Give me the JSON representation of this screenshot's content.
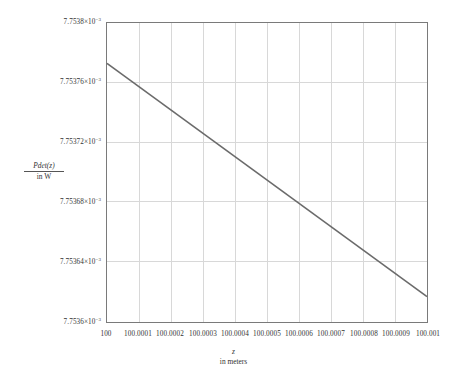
{
  "chart_data": {
    "type": "line",
    "title": "",
    "xlabel": "z",
    "xlabel_unit": "in meters",
    "ylabel_numerator": "Pdet(z)",
    "ylabel_denominator": "in W",
    "grid": true,
    "legend": "none",
    "xlim": [
      100,
      100.001
    ],
    "ylim": [
      0.0077536,
      0.0077538
    ],
    "x_tick_values": [
      100,
      100.0001,
      100.0002,
      100.0003,
      100.0004,
      100.0005,
      100.0006,
      100.0007,
      100.0008,
      100.0009,
      100.001
    ],
    "x_tick_labels": [
      "100",
      "100.0001",
      "100.0002",
      "100.0003",
      "100.0004",
      "100.0005",
      "100.0006",
      "100.0007",
      "100.0008",
      "100.0009",
      "100.001"
    ],
    "y_tick_values": [
      0.0077536,
      0.00775364,
      0.00775368,
      0.00775372,
      0.00775376,
      0.0077538
    ],
    "y_tick_labels": [
      {
        "mantissa": "7.7536×10",
        "exponent": "−3"
      },
      {
        "mantissa": "7.75364×10",
        "exponent": "−3"
      },
      {
        "mantissa": "7.75368×10",
        "exponent": "−3"
      },
      {
        "mantissa": "7.75372×10",
        "exponent": "−3"
      },
      {
        "mantissa": "7.75376×10",
        "exponent": "−3"
      },
      {
        "mantissa": "7.7538×10",
        "exponent": "−3"
      }
    ],
    "y_tick_labels_shown": [
      {
        "mantissa": "7.7538×10",
        "exponent": "−3",
        "value": 0.0077538
      },
      {
        "mantissa": "7.75376×10",
        "exponent": "−3",
        "value": 0.00775376
      },
      {
        "mantissa": "7.75372×10",
        "exponent": "−3",
        "value": 0.00775372
      },
      {
        "mantissa": "7.75368×10",
        "exponent": "−3",
        "value": 0.00775368
      },
      {
        "mantissa": "7.75364×10",
        "exponent": "−3",
        "value": 0.00775364
      },
      {
        "mantissa": "7.7536×10",
        "exponent": "−3",
        "value": 0.0077536
      }
    ],
    "series": [
      {
        "name": "Pdet(z)/W",
        "color": "#6b6b6b",
        "x": [
          100,
          100.001
        ],
        "y": [
          0.007753773,
          0.007753617
        ]
      }
    ],
    "axis_color": "#7a7a7a",
    "grid_color": "#d8d8d8",
    "background": "#ffffff"
  }
}
